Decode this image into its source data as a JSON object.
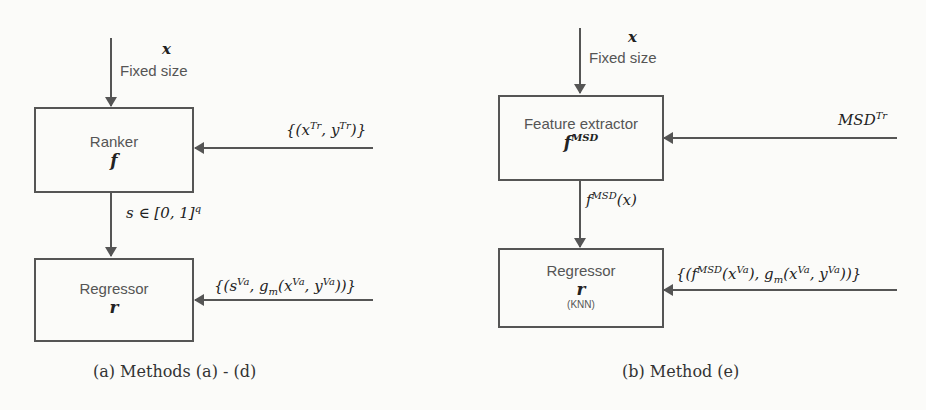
{
  "diagrams": [
    {
      "id": "a",
      "input_top": {
        "symbol": "x",
        "note": "Fixed size"
      },
      "block1": {
        "title": "Ranker",
        "symbol": "f"
      },
      "side_input1": "{(x^Tr, y^Tr)}",
      "intermediate": "s ∈ [0, 1]^q",
      "block2": {
        "title": "Regressor",
        "symbol": "r"
      },
      "side_input2": "{(s^Va, g_m(x^Va, y^Va))}",
      "caption": "(a) Methods (a) - (d)"
    },
    {
      "id": "b",
      "input_top": {
        "symbol": "x",
        "note": "Fixed size"
      },
      "block1": {
        "title": "Feature extractor",
        "symbol": "f^MSD"
      },
      "side_input1": "MSD^Tr",
      "intermediate": "f^MSD(x)",
      "block2": {
        "title": "Regressor",
        "symbol": "r",
        "subtitle": "(KNN)"
      },
      "side_input2": "{(f^MSD(x^Va), g_m(x^Va, y^Va))}",
      "caption": "(b) Method (e)"
    }
  ],
  "colors": {
    "line": "#555555",
    "background": "#fbfbf9",
    "text": "#222222"
  }
}
